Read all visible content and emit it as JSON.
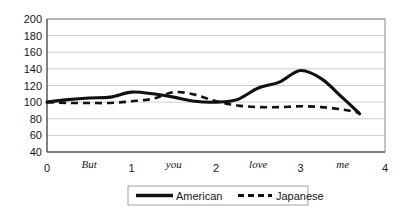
{
  "chart_data": {
    "type": "line",
    "title": "",
    "subtitle": "",
    "xlabel": "",
    "ylabel": "",
    "xlim": [
      0,
      4
    ],
    "ylim": [
      40,
      200
    ],
    "grid": true,
    "legend_position": "bottom",
    "y_ticks": [
      200,
      180,
      160,
      140,
      120,
      100,
      80,
      60,
      40
    ],
    "x_ticks": [
      0,
      1,
      2,
      3,
      4
    ],
    "x_word_annotations": [
      {
        "label": "But",
        "x": 0.5
      },
      {
        "label": "you",
        "x": 1.5
      },
      {
        "label": "love",
        "x": 2.5
      },
      {
        "label": "me",
        "x": 3.5
      }
    ],
    "categories": [
      0,
      0.25,
      0.5,
      0.75,
      1.0,
      1.25,
      1.5,
      1.75,
      2.0,
      2.25,
      2.5,
      2.75,
      3.0,
      3.25,
      3.5,
      3.7
    ],
    "series": [
      {
        "name": "American",
        "style": "solid",
        "color": "#111111",
        "x": [
          0,
          0.25,
          0.5,
          0.75,
          1.0,
          1.25,
          1.5,
          1.75,
          2.0,
          2.25,
          2.5,
          2.75,
          3.0,
          3.25,
          3.5,
          3.7
        ],
        "values": [
          100,
          103,
          105,
          106,
          112,
          110,
          106,
          101,
          100,
          103,
          117,
          124,
          138,
          128,
          105,
          86
        ]
      },
      {
        "name": "Japanese",
        "style": "dashed",
        "color": "#111111",
        "x": [
          0,
          0.25,
          0.5,
          0.75,
          1.0,
          1.25,
          1.5,
          1.75,
          2.0,
          2.25,
          2.5,
          2.75,
          3.0,
          3.25,
          3.5,
          3.7
        ],
        "values": [
          100,
          99,
          99,
          99,
          101,
          104,
          112,
          109,
          101,
          96,
          94,
          94,
          95,
          94,
          91,
          87
        ]
      }
    ],
    "legend": [
      {
        "label": "American",
        "style": "solid"
      },
      {
        "label": "Japanese",
        "style": "dashed"
      }
    ]
  }
}
